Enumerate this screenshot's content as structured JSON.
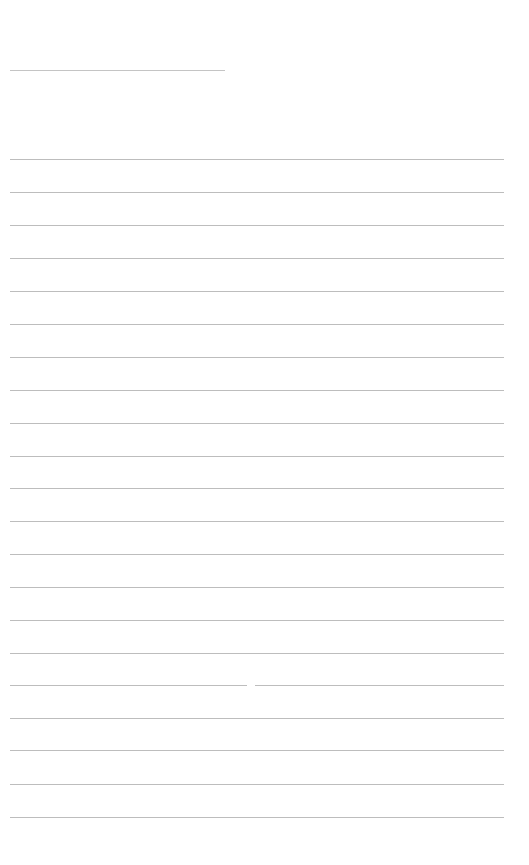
{
  "document": {
    "type": "blank-lined-page",
    "line_color": "#bdbdbd",
    "background_color": "#ffffff",
    "header_line": {
      "x": 10,
      "y": 70,
      "width": 215
    },
    "ruled_lines": {
      "x": 10,
      "width": 494,
      "count": 21,
      "y_positions": [
        159,
        192,
        225,
        258,
        291,
        324,
        357,
        390,
        423,
        456,
        488,
        521,
        554,
        587,
        620,
        653,
        685,
        718,
        750,
        784,
        817
      ]
    },
    "gap": {
      "line_index": 16,
      "x": 247,
      "width": 8
    }
  }
}
